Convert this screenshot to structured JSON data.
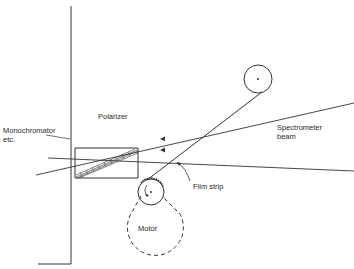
{
  "diagram": {
    "labels": {
      "monochromator_line1": "Monochromator",
      "monochromator_line2": "etc.",
      "polarizer": "Polarizer",
      "spectrometer_line1": "Spectrometer",
      "spectrometer_line2": "beam",
      "film_strip": "Film strip",
      "motor": "Motor"
    },
    "colors": {
      "stroke": "#333333",
      "background": "#ffffff"
    }
  }
}
